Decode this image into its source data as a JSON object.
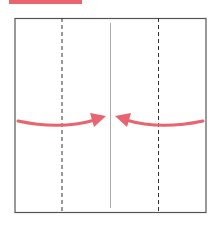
{
  "colors": {
    "accent": "#e8646f",
    "outline": "#555555",
    "dashed": "#333333",
    "center_line": "#aaaaaa",
    "background": "#ffffff"
  },
  "diagram": {
    "type": "folding-instruction",
    "square": {
      "x": 15,
      "y": 18,
      "width": 191,
      "height": 194
    },
    "dashed_fold_lines_x": [
      62,
      158
    ],
    "center_line_x": 110,
    "arrows": [
      {
        "name": "left-fold-arrow",
        "from": "left",
        "to": "center"
      },
      {
        "name": "right-fold-arrow",
        "from": "right",
        "to": "center"
      }
    ]
  }
}
